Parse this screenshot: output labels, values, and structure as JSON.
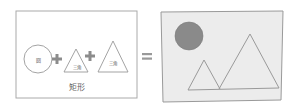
{
  "left_panel": {
    "circle_label": "圆",
    "triangle1_label": "三角",
    "triangle2_label": "三角",
    "caption": "矩形",
    "operator1": "+",
    "operator2": "+"
  },
  "equals": "=",
  "colors": {
    "stroke": "#9a9a9a",
    "plus": "#8c8c8c",
    "right_fill": "#ececec",
    "sun": "#8a8a8a"
  }
}
